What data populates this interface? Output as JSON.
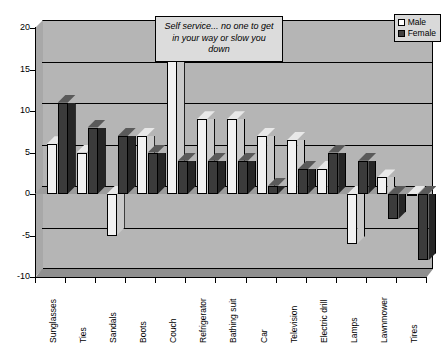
{
  "chart_data": {
    "type": "bar",
    "title": "",
    "subtitle": "",
    "xlabel": "",
    "ylabel": "",
    "ylim": [
      -10,
      20
    ],
    "yticks": [
      20,
      15,
      10,
      5,
      0,
      -5,
      -10
    ],
    "ytick_labels": [
      "20",
      "15",
      "10",
      "5",
      "0",
      "-5",
      "-10"
    ],
    "grid": true,
    "legend_position": "top-right",
    "categories": [
      "Sunglasses",
      "Ties",
      "Sandals",
      "Boots",
      "Couch",
      "Refrigerator",
      "Bathing suit",
      "Car",
      "Television",
      "Electric drill",
      "Lamps",
      "Lawnmower",
      "Tires"
    ],
    "series": [
      {
        "name": "Male",
        "color": "#ffffff",
        "values": [
          6,
          5,
          -5,
          7,
          19,
          9,
          9,
          7,
          6.5,
          3,
          -6,
          2,
          0
        ]
      },
      {
        "name": "Female",
        "color": "#404040",
        "values": [
          11,
          8,
          7,
          5,
          4,
          4,
          4,
          1,
          3,
          5,
          4,
          -3,
          -8
        ]
      }
    ],
    "annotations": [
      {
        "name": "self-service-callout",
        "text": "Self service...  no one to get in your way or slow you down"
      }
    ]
  },
  "legend": {
    "entries": [
      {
        "label": "Male",
        "key": "male-swatch"
      },
      {
        "label": "Female",
        "key": "female-swatch"
      }
    ]
  }
}
